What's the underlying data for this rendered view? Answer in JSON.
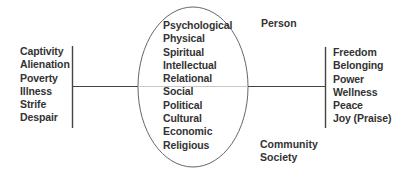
{
  "diagram": {
    "left_list": [
      "Captivity",
      "Alienation",
      "Poverty",
      "Illness",
      "Strife",
      "Despair"
    ],
    "center_list": [
      "Psychological",
      "Physical",
      "Spiritual",
      "Intellectual",
      "Relational",
      "Social",
      "Political",
      "Cultural",
      "Economic",
      "Religious"
    ],
    "right_list": [
      "Freedom",
      "Belonging",
      "Power",
      "Wellness",
      "Peace",
      "Joy (Praise)"
    ],
    "top_label": "Person",
    "bottom_labels": [
      "Community",
      "Society"
    ]
  },
  "colors": {
    "line": "#444444",
    "inner_line": "#c8c8c8",
    "ellipse": "#666666",
    "text": "#333333"
  }
}
